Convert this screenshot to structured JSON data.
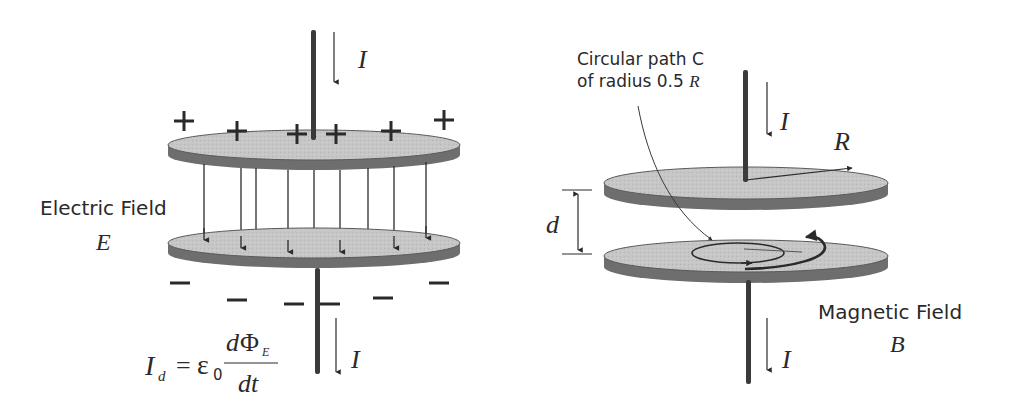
{
  "left_panel": {
    "title": "Parallel-plate capacitor charging (electric field)",
    "current_top_label": "I",
    "current_bottom_label": "I",
    "field_label": "Electric Field",
    "field_symbol": "E",
    "top_plate_charge": "+",
    "bottom_plate_charge": "−",
    "equation": {
      "lhs": "I",
      "lhs_sub": "d",
      "equals": "=",
      "epsilon": "ε",
      "epsilon_sub": "0",
      "numerator_d": "d",
      "numerator_phi": "Φ",
      "numerator_sub": "E",
      "denominator": "dt"
    },
    "plus_count": 7,
    "minus_count": 7,
    "field_line_count": 9
  },
  "right_panel": {
    "title": "Parallel-plate capacitor (magnetic field)",
    "path_label_line1": "Circular path C",
    "path_label_line2_prefix": "of radius 0.5 ",
    "path_label_line2_symbol": "R",
    "current_top_label": "I",
    "current_bottom_label": "I",
    "radius_label": "R",
    "separation_label": "d",
    "field_label": "Magnetic Field",
    "field_symbol": "B"
  },
  "colors": {
    "plate_top": "#c4c4c4",
    "plate_edge": "#6e6e6e",
    "wire": "#3a3a3a",
    "arrow": "#2a2a2a",
    "text": "#2a2a2a"
  }
}
